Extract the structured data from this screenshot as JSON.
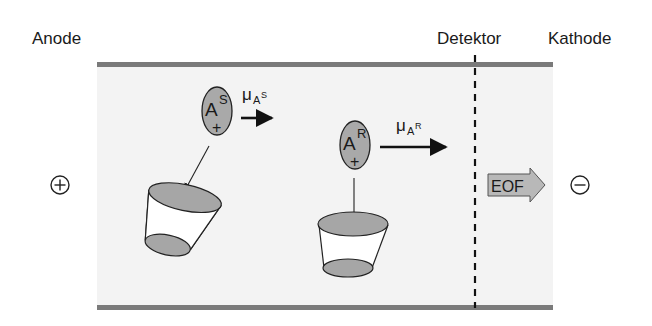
{
  "labels": {
    "anode": "Anode",
    "detector": "Detektor",
    "cathode": "Kathode",
    "eof": "EOF",
    "plus_electrode": "⊕",
    "minus_electrode": "⊖"
  },
  "ions": [
    {
      "id": "S",
      "symbol": "A",
      "superscript": "S",
      "charge": "+",
      "mobility_symbol": "μ",
      "mobility_sub": "A",
      "mobility_sup": "S"
    },
    {
      "id": "R",
      "symbol": "A",
      "superscript": "R",
      "charge": "+",
      "mobility_symbol": "μ",
      "mobility_sub": "A",
      "mobility_sup": "R"
    }
  ],
  "colors": {
    "capillary_wall": "#7a7a7a",
    "capillary_fill": "#f3f3f3",
    "ion_fill": "#a9a9a9",
    "cup_fill": "#a6a6a6",
    "eof_fill": "#b8b8b8",
    "stroke": "#1a1a1a"
  }
}
